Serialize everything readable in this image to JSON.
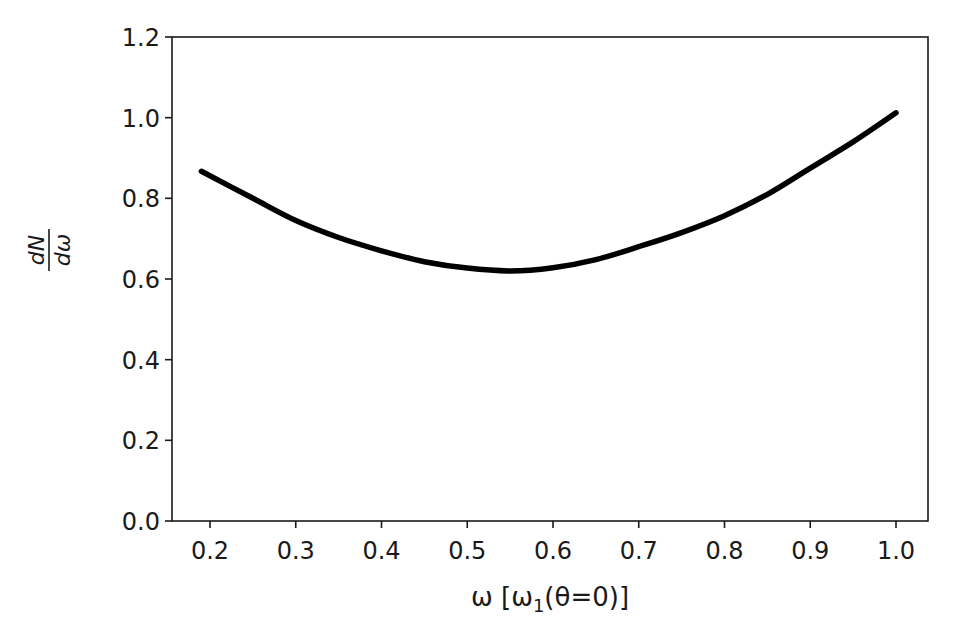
{
  "chart_data": {
    "type": "line",
    "title": "",
    "xlabel": "ω [ω₁(θ=0)]",
    "xlabel_parts": {
      "main": "ω [ω",
      "sub": "1",
      "tail": "(θ=0)]"
    },
    "ylabel": "dN/dω",
    "ylabel_parts": {
      "numerator": "dN",
      "denominator": "dω"
    },
    "xlim": [
      0.16,
      1.04
    ],
    "ylim": [
      0.0,
      1.2
    ],
    "xticks": [
      0.2,
      0.3,
      0.4,
      0.5,
      0.6,
      0.7,
      0.8,
      0.9,
      1.0
    ],
    "xtick_labels": [
      "0.2",
      "0.3",
      "0.4",
      "0.5",
      "0.6",
      "0.7",
      "0.8",
      "0.9",
      "1.0"
    ],
    "yticks": [
      0.0,
      0.2,
      0.4,
      0.6,
      0.8,
      1.0,
      1.2
    ],
    "ytick_labels": [
      "0.0",
      "0.2",
      "0.4",
      "0.6",
      "0.8",
      "1.0",
      "1.2"
    ],
    "grid": false,
    "legend": null,
    "series": [
      {
        "name": "dN/dω",
        "color": "#000000",
        "x": [
          0.19,
          0.25,
          0.3,
          0.35,
          0.4,
          0.45,
          0.5,
          0.55,
          0.6,
          0.65,
          0.7,
          0.75,
          0.8,
          0.85,
          0.9,
          0.95,
          1.0
        ],
        "values": [
          0.867,
          0.8,
          0.745,
          0.703,
          0.67,
          0.643,
          0.627,
          0.62,
          0.628,
          0.648,
          0.68,
          0.715,
          0.757,
          0.81,
          0.875,
          0.94,
          1.012
        ]
      }
    ]
  }
}
